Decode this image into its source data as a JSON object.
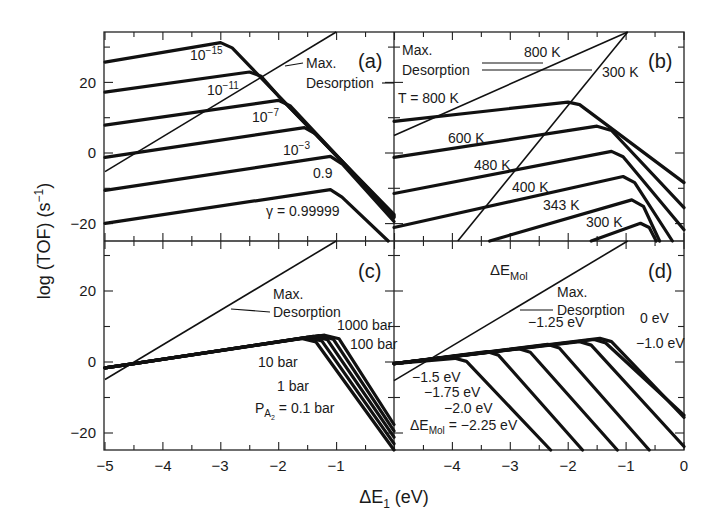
{
  "figure": {
    "y_axis_title": "log (TOF) (s",
    "y_axis_title_sup": "−1",
    "y_axis_title_end": ")",
    "x_axis_title_main": "ΔE",
    "x_axis_title_sub": "1",
    "x_axis_title_end": " (eV)"
  },
  "chart_data": [
    {
      "panel": "(a)",
      "type": "line",
      "xlabel": "ΔE1 (eV)",
      "ylabel": "log (TOF) (s^-1)",
      "xlim": [
        -5,
        0
      ],
      "ylim": [
        -25,
        34
      ],
      "xticks": [
        -5,
        -4,
        -3,
        -2,
        -1
      ],
      "yticks": [
        -20,
        0,
        20
      ],
      "legend_title": "γ",
      "series": [
        {
          "name": "γ=10^-15",
          "label": "10",
          "label_sup": "−15",
          "points": [
            [
              -5,
              25.5
            ],
            [
              -3.0,
              31
            ],
            [
              -2.8,
              29.5
            ],
            [
              -2.0,
              16
            ],
            [
              0,
              -17.5
            ]
          ]
        },
        {
          "name": "γ=10^-11",
          "label": "10",
          "label_sup": "−11",
          "points": [
            [
              -5,
              17
            ],
            [
              -2.5,
              22.7
            ],
            [
              -2.3,
              21.5
            ],
            [
              -2.0,
              16
            ],
            [
              0,
              -17.8
            ]
          ]
        },
        {
          "name": "γ=10^-7",
          "label": "10",
          "label_sup": "−7",
          "points": [
            [
              -5,
              7.7
            ],
            [
              -2.0,
              14.7
            ],
            [
              -1.8,
              13.2
            ],
            [
              0,
              -18.1
            ]
          ]
        },
        {
          "name": "γ=10^-3",
          "label": "10",
          "label_sup": "−3",
          "points": [
            [
              -5,
              -1.4
            ],
            [
              -1.55,
              7
            ],
            [
              -1.35,
              5.2
            ],
            [
              0,
              -18.4
            ]
          ]
        },
        {
          "name": "γ=0.9",
          "label": "0.9",
          "label_sup": "",
          "points": [
            [
              -5,
              -10.7
            ],
            [
              -1.1,
              -1.1
            ],
            [
              -0.9,
              -3.2
            ],
            [
              0,
              -19.5
            ]
          ]
        },
        {
          "name": "γ=0.99999",
          "label": "γ = 0.99999",
          "label_sup": "",
          "points": [
            [
              -5,
              -20
            ],
            [
              -1.1,
              -10.5
            ],
            [
              -0.9,
              -12.6
            ],
            [
              -0.1,
              -25
            ]
          ]
        },
        {
          "name": "Max. Desorption",
          "style": "thin",
          "points": [
            [
              -5,
              -5.4
            ],
            [
              -1.0,
              34
            ]
          ]
        }
      ],
      "annotations": [
        {
          "text_1": "Max.",
          "text_2": "Desorption"
        }
      ]
    },
    {
      "panel": "(b)",
      "type": "line",
      "xlim": [
        -5,
        0
      ],
      "ylim": [
        -25,
        34
      ],
      "series": [
        {
          "name": "T=800 K",
          "label": "T = 800 K",
          "points": [
            [
              -5,
              8.8
            ],
            [
              -2.0,
              14.2
            ],
            [
              -1.8,
              13.5
            ],
            [
              0,
              -8.5
            ]
          ]
        },
        {
          "name": "600 K",
          "label": "600 K",
          "points": [
            [
              -5,
              -1.4
            ],
            [
              -1.5,
              7.4
            ],
            [
              -1.25,
              6.2
            ],
            [
              0,
              -15.6
            ]
          ]
        },
        {
          "name": "480 K",
          "label": "480 K",
          "points": [
            [
              -5,
              -11.6
            ],
            [
              -1.25,
              0.3
            ],
            [
              -1.05,
              -1.2
            ],
            [
              0,
              -21.8
            ]
          ]
        },
        {
          "name": "400 K",
          "label": "400 K",
          "points": [
            [
              -5,
              -21.2
            ],
            [
              -1.05,
              -6.8
            ],
            [
              -0.85,
              -8.5
            ],
            [
              -0.2,
              -25
            ]
          ]
        },
        {
          "name": "343 K",
          "label": "343 K",
          "points": [
            [
              -3.35,
              -25
            ],
            [
              -0.9,
              -13.4
            ],
            [
              -0.7,
              -15.2
            ],
            [
              -0.42,
              -25
            ]
          ]
        },
        {
          "name": "300 K",
          "label": "300 K",
          "points": [
            [
              -1.6,
              -25
            ],
            [
              -0.75,
              -20
            ],
            [
              -0.6,
              -21.2
            ],
            [
              -0.48,
              -25
            ]
          ]
        },
        {
          "name": "Max. Desorption 800 K",
          "style": "thin",
          "points": [
            [
              -5,
              4.8
            ],
            [
              -0.97,
              34
            ]
          ]
        },
        {
          "name": "Max. Desorption 300 K",
          "style": "thin",
          "points": [
            [
              -3.9,
              -25
            ],
            [
              -0.97,
              34
            ]
          ]
        }
      ],
      "annotations": [
        {
          "text_1": "Max.",
          "text_2": "Desorption",
          "arrow_1": "800 K",
          "arrow_2": "300 K"
        }
      ]
    },
    {
      "panel": "(c)",
      "type": "line",
      "xlim": [
        -5,
        0
      ],
      "ylim": [
        -25,
        34
      ],
      "xticks": [
        -5,
        -4,
        -3,
        -2,
        -1
      ],
      "yticks": [
        -20,
        0,
        20
      ],
      "series": [
        {
          "name": "P_A2=0.1 bar",
          "label": "P",
          "label_sub": "A",
          "label_subsub": "2",
          "label_end": " = 0.1 bar",
          "points": [
            [
              -5,
              -1.8
            ],
            [
              -4.5,
              -0.6
            ],
            [
              -1.6,
              6.5
            ],
            [
              -1.35,
              5.5
            ],
            [
              0,
              -25
            ]
          ]
        },
        {
          "name": "1 bar",
          "label": "1 bar",
          "points": [
            [
              -5,
              -1.8
            ],
            [
              -4.5,
              -0.6
            ],
            [
              -1.5,
              6.8
            ],
            [
              -1.25,
              5.8
            ],
            [
              0,
              -23.2
            ]
          ]
        },
        {
          "name": "10 bar",
          "label": "10 bar",
          "points": [
            [
              -5,
              -1.8
            ],
            [
              -4.5,
              -0.6
            ],
            [
              -1.4,
              7.1
            ],
            [
              -1.15,
              6.1
            ],
            [
              0,
              -21.4
            ]
          ]
        },
        {
          "name": "100 bar",
          "label": "100 bar",
          "points": [
            [
              -5,
              -1.8
            ],
            [
              -4.5,
              -0.6
            ],
            [
              -1.3,
              7.3
            ],
            [
              -1.05,
              6.3
            ],
            [
              0,
              -19.6
            ]
          ]
        },
        {
          "name": "1000 bar",
          "label": "1000 bar",
          "points": [
            [
              -5,
              -1.8
            ],
            [
              -4.5,
              -0.6
            ],
            [
              -1.2,
              7.4
            ],
            [
              -0.95,
              6.4
            ],
            [
              0,
              -17.8
            ]
          ]
        },
        {
          "name": "Max. Desorption",
          "style": "thin",
          "points": [
            [
              -5,
              -5.1
            ],
            [
              -1.0,
              34
            ]
          ]
        }
      ],
      "annotations": [
        {
          "text_1": "Max.",
          "text_2": "Desorption"
        }
      ]
    },
    {
      "panel": "(d)",
      "type": "line",
      "xlim": [
        -5,
        0
      ],
      "ylim": [
        -25,
        34
      ],
      "xticks": [
        -4,
        -3,
        -2,
        -1,
        0
      ],
      "legend_title": "ΔE_Mol",
      "series": [
        {
          "name": "ΔE_Mol=-2.25 eV",
          "label": "ΔE",
          "label_sub": "Mol",
          "label_end": " = −2.25 eV",
          "points": [
            [
              -5,
              -0.6
            ],
            [
              -3.95,
              0.9
            ],
            [
              -3.75,
              0
            ],
            [
              -2.3,
              -25
            ]
          ]
        },
        {
          "name": "-2.0 eV",
          "label": "−2.0 eV",
          "points": [
            [
              -5,
              -0.6
            ],
            [
              -3.4,
              2.8
            ],
            [
              -3.2,
              1.8
            ],
            [
              -1.75,
              -25
            ]
          ]
        },
        {
          "name": "-1.75 eV",
          "label": "−1.75 eV",
          "points": [
            [
              -5,
              -0.6
            ],
            [
              -2.85,
              3.6
            ],
            [
              -2.65,
              2.6
            ],
            [
              -1.15,
              -25
            ]
          ]
        },
        {
          "name": "-1.5 eV",
          "label": "−1.5 eV",
          "points": [
            [
              -5,
              -0.6
            ],
            [
              -2.35,
              4.8
            ],
            [
              -2.15,
              3.8
            ],
            [
              -0.6,
              -25
            ]
          ]
        },
        {
          "name": "-1.25 eV",
          "label": "−1.25 eV",
          "points": [
            [
              -5,
              -0.6
            ],
            [
              -1.8,
              5.6
            ],
            [
              -1.6,
              4.6
            ],
            [
              0,
              -24
            ]
          ]
        },
        {
          "name": "-1.0 eV",
          "label": "−1.0 eV",
          "points": [
            [
              -5,
              -0.6
            ],
            [
              -1.55,
              6.2
            ],
            [
              -1.35,
              5.2
            ],
            [
              0,
              -15.2
            ]
          ]
        },
        {
          "name": "0 eV",
          "label": "0 eV",
          "points": [
            [
              -5,
              -0.6
            ],
            [
              -1.45,
              6.5
            ],
            [
              -1.25,
              5.6
            ],
            [
              0,
              -15.8
            ]
          ]
        },
        {
          "name": "Max. Desorption",
          "style": "thin",
          "points": [
            [
              -5,
              -5.4
            ],
            [
              -0.97,
              34
            ]
          ]
        }
      ],
      "annotations": [
        {
          "text_1": "Max.",
          "text_2": "Desorption"
        }
      ]
    }
  ]
}
